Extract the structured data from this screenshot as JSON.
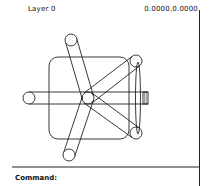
{
  "header": {
    "layer_label": "Layer 0",
    "coordinates": "0.0000,0.0000"
  },
  "command_line": {
    "prompt": "Command:"
  },
  "drawing": {
    "description": "Top view of swivel office chair: rounded square seat, five-star base with castor wheels, armrest/back ellipse and knob",
    "stroke_color": "#222222",
    "background": "#ffffff"
  }
}
